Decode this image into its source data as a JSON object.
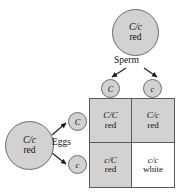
{
  "diagram": {
    "colors": {
      "fill_gray": "#d2d2d2",
      "outline": "#5a5a5a",
      "plain": "#ffffff"
    }
  },
  "sperm_parent": {
    "genotype": "C/c",
    "phenotype": "red"
  },
  "egg_parent": {
    "genotype": "C/c",
    "phenotype": "red"
  },
  "labels": {
    "sperm": "Sperm",
    "eggs": "Eggs"
  },
  "sperm_gametes": [
    {
      "allele": "C"
    },
    {
      "allele": "c"
    }
  ],
  "egg_gametes": [
    {
      "allele": "C"
    },
    {
      "allele": "c"
    }
  ],
  "punnett": {
    "cells": [
      {
        "genotype": "C/C",
        "phenotype": "red",
        "shaded": true
      },
      {
        "genotype": "C/c",
        "phenotype": "red",
        "shaded": true
      },
      {
        "genotype": "c/C",
        "phenotype": "red",
        "shaded": true
      },
      {
        "genotype": "c/c",
        "phenotype": "white",
        "shaded": false
      }
    ]
  }
}
